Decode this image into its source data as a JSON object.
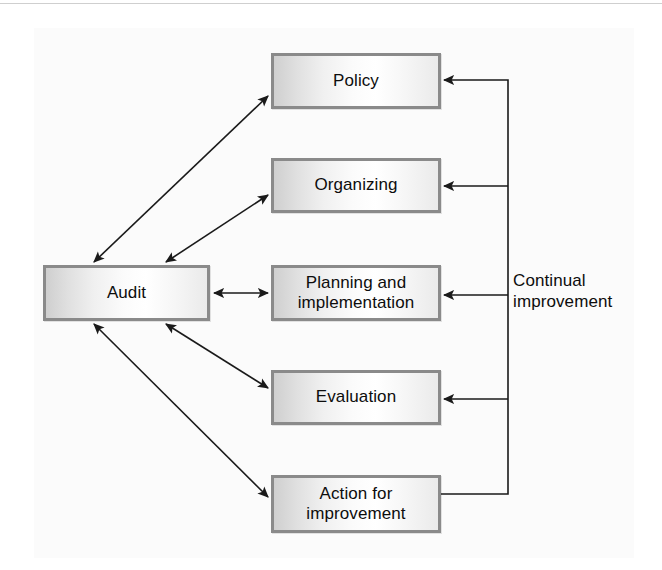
{
  "diagram": {
    "type": "cycle-flow-diagram",
    "background_color": "#ffffff",
    "node_fill_start": "#cfcfcf",
    "node_fill_end": "#ffffff",
    "node_border_color": "#8a8a8a",
    "line_color": "#1a1a1a",
    "nodes": [
      {
        "id": "policy",
        "label": "Policy",
        "x": 271,
        "y": 53,
        "w": 170,
        "h": 56
      },
      {
        "id": "organizing",
        "label": "Organizing",
        "x": 271,
        "y": 158,
        "w": 170,
        "h": 55
      },
      {
        "id": "planning",
        "label": "Planning and implementation",
        "line1": "Planning and",
        "line2": "implementation",
        "x": 271,
        "y": 265,
        "w": 170,
        "h": 56
      },
      {
        "id": "evaluation",
        "label": "Evaluation",
        "x": 271,
        "y": 370,
        "w": 170,
        "h": 55
      },
      {
        "id": "action",
        "label": "Action for improvement",
        "line1": "Action for",
        "line2": "improvement",
        "x": 271,
        "y": 475,
        "w": 170,
        "h": 58
      },
      {
        "id": "audit",
        "label": "Audit",
        "x": 43,
        "y": 265,
        "w": 167,
        "h": 56
      }
    ],
    "caption": {
      "id": "continual-improvement",
      "line1": "Continual",
      "line2": "improvement",
      "x": 513,
      "y": 270
    },
    "connections": [
      {
        "from": "audit",
        "to": "policy",
        "style": "double-arrow-diagonal"
      },
      {
        "from": "audit",
        "to": "organizing",
        "style": "double-arrow-diagonal"
      },
      {
        "from": "audit",
        "to": "planning",
        "style": "double-arrow-horizontal"
      },
      {
        "from": "audit",
        "to": "evaluation",
        "style": "double-arrow-diagonal"
      },
      {
        "from": "audit",
        "to": "action",
        "style": "double-arrow-diagonal"
      },
      {
        "from": "action",
        "to": "policy",
        "style": "feedback-bus-arrow"
      },
      {
        "from": "feedback-bus",
        "to": "organizing",
        "style": "arrow-left"
      },
      {
        "from": "feedback-bus",
        "to": "planning",
        "style": "arrow-left"
      },
      {
        "from": "feedback-bus",
        "to": "evaluation",
        "style": "arrow-left"
      }
    ]
  }
}
